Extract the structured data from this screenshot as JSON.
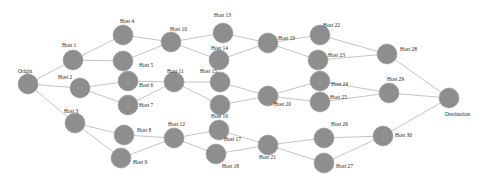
{
  "diagram": {
    "type": "network-graph",
    "colors": {
      "node_fill": "#8e8e8e",
      "edge": "#c4c4c4",
      "label": "#222222",
      "background": "#ffffff"
    },
    "node_radius": 10,
    "nodes": [
      {
        "id": "origin",
        "label": "Origin",
        "x": 28,
        "y": 84,
        "lx": 18,
        "ly": 73
      },
      {
        "id": "h1",
        "label": "Host 1",
        "x": 73,
        "y": 60,
        "lx": 62,
        "ly": 47
      },
      {
        "id": "h2",
        "label": "Host 2",
        "x": 80,
        "y": 88,
        "lx": 58,
        "ly": 79
      },
      {
        "id": "h3",
        "label": "Host 3",
        "x": 75,
        "y": 123,
        "lx": 64,
        "ly": 113
      },
      {
        "id": "h4",
        "label": "Host 4",
        "x": 123,
        "y": 35,
        "lx": 120,
        "ly": 23
      },
      {
        "id": "h5",
        "label": "Host 5",
        "x": 123,
        "y": 61,
        "lx": 139,
        "ly": 67
      },
      {
        "id": "h6",
        "label": "Host 6",
        "x": 128,
        "y": 81,
        "lx": 139,
        "ly": 87
      },
      {
        "id": "h7",
        "label": "Host 7",
        "x": 128,
        "y": 105,
        "lx": 139,
        "ly": 107
      },
      {
        "id": "h8",
        "label": "Host 8",
        "x": 124,
        "y": 135,
        "lx": 137,
        "ly": 132
      },
      {
        "id": "h9",
        "label": "Host 9",
        "x": 121,
        "y": 158,
        "lx": 133,
        "ly": 164
      },
      {
        "id": "h10",
        "label": "Host 10",
        "x": 171,
        "y": 42,
        "lx": 170,
        "ly": 31
      },
      {
        "id": "h11",
        "label": "Host 11",
        "x": 174,
        "y": 82,
        "lx": 167,
        "ly": 73
      },
      {
        "id": "h12",
        "label": "Host 12",
        "x": 174,
        "y": 138,
        "lx": 168,
        "ly": 126
      },
      {
        "id": "h13",
        "label": "Host 13",
        "x": 223,
        "y": 33,
        "lx": 214,
        "ly": 17
      },
      {
        "id": "h14",
        "label": "Host 14",
        "x": 219,
        "y": 60,
        "lx": 211,
        "ly": 50
      },
      {
        "id": "h15",
        "label": "Host 15",
        "x": 220,
        "y": 82,
        "lx": 200,
        "ly": 73
      },
      {
        "id": "h16",
        "label": "Host 16",
        "x": 220,
        "y": 105,
        "lx": 211,
        "ly": 118
      },
      {
        "id": "h17",
        "label": "Host 17",
        "x": 219,
        "y": 130,
        "lx": 224,
        "ly": 141
      },
      {
        "id": "h18",
        "label": "Host 18",
        "x": 216,
        "y": 154,
        "lx": 222,
        "ly": 168
      },
      {
        "id": "h19",
        "label": "Host 19",
        "x": 268,
        "y": 43,
        "lx": 278,
        "ly": 40
      },
      {
        "id": "h20",
        "label": "Host 20",
        "x": 268,
        "y": 96,
        "lx": 274,
        "ly": 106
      },
      {
        "id": "h21",
        "label": "Host 21",
        "x": 268,
        "y": 145,
        "lx": 259,
        "ly": 159
      },
      {
        "id": "h22",
        "label": "Host 22",
        "x": 320,
        "y": 35,
        "lx": 323,
        "ly": 27
      },
      {
        "id": "h23",
        "label": "Host 23",
        "x": 318,
        "y": 60,
        "lx": 328,
        "ly": 57
      },
      {
        "id": "h24",
        "label": "Host 24",
        "x": 320,
        "y": 81,
        "lx": 331,
        "ly": 86
      },
      {
        "id": "h25",
        "label": "Host 25",
        "x": 320,
        "y": 102,
        "lx": 330,
        "ly": 99
      },
      {
        "id": "h26",
        "label": "Host 26",
        "x": 324,
        "y": 138,
        "lx": 331,
        "ly": 126
      },
      {
        "id": "h27",
        "label": "Host 27",
        "x": 324,
        "y": 163,
        "lx": 336,
        "ly": 168
      },
      {
        "id": "h28",
        "label": "Host 28",
        "x": 387,
        "y": 54,
        "lx": 400,
        "ly": 51
      },
      {
        "id": "h29",
        "label": "Host 29",
        "x": 389,
        "y": 93,
        "lx": 387,
        "ly": 81
      },
      {
        "id": "h30",
        "label": "Host 30",
        "x": 383,
        "y": 136,
        "lx": 395,
        "ly": 137
      },
      {
        "id": "destination",
        "label": "Destination",
        "x": 449,
        "y": 98,
        "lx": 445,
        "ly": 116
      }
    ],
    "edges": [
      [
        "origin",
        "h1"
      ],
      [
        "origin",
        "h2"
      ],
      [
        "origin",
        "h3"
      ],
      [
        "h1",
        "h4"
      ],
      [
        "h1",
        "h5"
      ],
      [
        "h2",
        "h6"
      ],
      [
        "h2",
        "h7"
      ],
      [
        "h3",
        "h8"
      ],
      [
        "h3",
        "h9"
      ],
      [
        "h4",
        "h10"
      ],
      [
        "h5",
        "h10"
      ],
      [
        "h6",
        "h11"
      ],
      [
        "h7",
        "h11"
      ],
      [
        "h8",
        "h12"
      ],
      [
        "h9",
        "h12"
      ],
      [
        "h10",
        "h13"
      ],
      [
        "h10",
        "h14"
      ],
      [
        "h11",
        "h15"
      ],
      [
        "h11",
        "h16"
      ],
      [
        "h12",
        "h17"
      ],
      [
        "h12",
        "h18"
      ],
      [
        "h13",
        "h19"
      ],
      [
        "h14",
        "h19"
      ],
      [
        "h15",
        "h20"
      ],
      [
        "h16",
        "h20"
      ],
      [
        "h17",
        "h21"
      ],
      [
        "h18",
        "h21"
      ],
      [
        "h19",
        "h22"
      ],
      [
        "h19",
        "h23"
      ],
      [
        "h20",
        "h24"
      ],
      [
        "h20",
        "h25"
      ],
      [
        "h21",
        "h26"
      ],
      [
        "h21",
        "h27"
      ],
      [
        "h22",
        "h28"
      ],
      [
        "h23",
        "h28"
      ],
      [
        "h24",
        "h29"
      ],
      [
        "h25",
        "h29"
      ],
      [
        "h26",
        "h30"
      ],
      [
        "h27",
        "h30"
      ],
      [
        "h28",
        "destination"
      ],
      [
        "h29",
        "destination"
      ],
      [
        "h30",
        "destination"
      ]
    ]
  }
}
